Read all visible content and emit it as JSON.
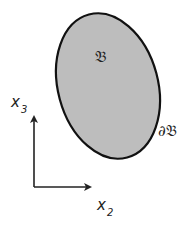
{
  "diagram": {
    "region_label": "𝔅",
    "boundary_label": "∂𝔅",
    "axes": {
      "vertical": {
        "label": "x",
        "subscript": "3"
      },
      "horizontal": {
        "label": "x",
        "subscript": "2"
      }
    },
    "colors": {
      "region_fill": "#bdbdbd",
      "stroke": "#111111",
      "background": "#ffffff"
    }
  }
}
